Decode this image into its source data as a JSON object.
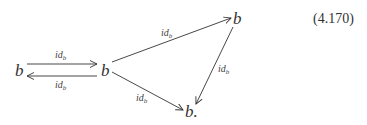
{
  "diagram": {
    "equation_number": "(4.170)",
    "nodes": {
      "left": "b",
      "middle": "b",
      "top_right": "b",
      "bottom": "b."
    },
    "edges": {
      "left_to_middle": {
        "base": "id",
        "sub": "b"
      },
      "middle_to_left": {
        "base": "id",
        "sub": "b"
      },
      "middle_to_top_right": {
        "base": "id",
        "sub": "b"
      },
      "top_right_to_bottom": {
        "base": "id",
        "sub": "b"
      },
      "middle_to_bottom": {
        "base": "id",
        "sub": "b"
      }
    },
    "colors": {
      "ink": "#333333",
      "background": "#ffffff"
    }
  }
}
